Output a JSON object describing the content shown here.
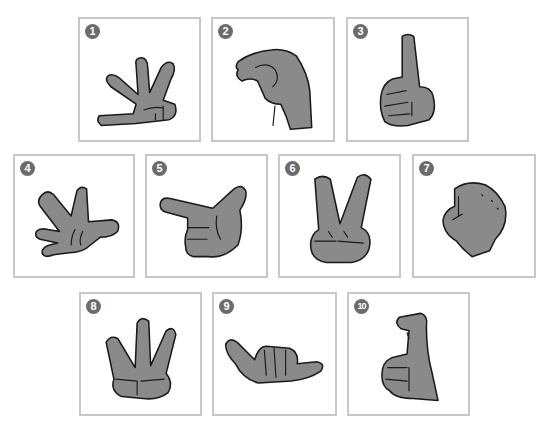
{
  "figure": {
    "panel_border_color": "#c8c8c8",
    "badge_color": "#6b6b6b",
    "panels": [
      {
        "number": "1",
        "gesture": "four-fingers-with-thumb-tucked-palm"
      },
      {
        "number": "2",
        "gesture": "pinched-fingertips-claw"
      },
      {
        "number": "3",
        "gesture": "index-finger-up-fist"
      },
      {
        "number": "4",
        "gesture": "open-hand-spread-fingers"
      },
      {
        "number": "5",
        "gesture": "finger-gun-pointing"
      },
      {
        "number": "6",
        "gesture": "v-sign-peace"
      },
      {
        "number": "7",
        "gesture": "closed-fist"
      },
      {
        "number": "8",
        "gesture": "three-fingers-up"
      },
      {
        "number": "9",
        "gesture": "shaka-thumb-pinky-out"
      },
      {
        "number": "10",
        "gesture": "hooked-index-finger-fist"
      }
    ]
  }
}
